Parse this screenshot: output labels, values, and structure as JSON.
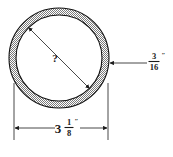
{
  "figure": {
    "type": "engineering-cross-section",
    "background_color": "#ffffff",
    "line_color": "#1a1a1a",
    "fill_pattern": "stipple-halftone"
  },
  "shape": {
    "outer_circle": {
      "cx": 59,
      "cy": 58,
      "r": 50
    },
    "inner_circle": {
      "cx": 59,
      "cy": 58,
      "r": 43
    }
  },
  "labels": {
    "unknown_diameter": {
      "text": "?",
      "description": "inner diameter unknown"
    },
    "wall_thickness": {
      "numerator": "3",
      "denominator": "16",
      "unit": "″",
      "full": "3/16″"
    },
    "outer_diameter": {
      "whole": "3",
      "numerator": "1",
      "denominator": "8",
      "unit": "″",
      "full": "3 1/8″"
    }
  }
}
